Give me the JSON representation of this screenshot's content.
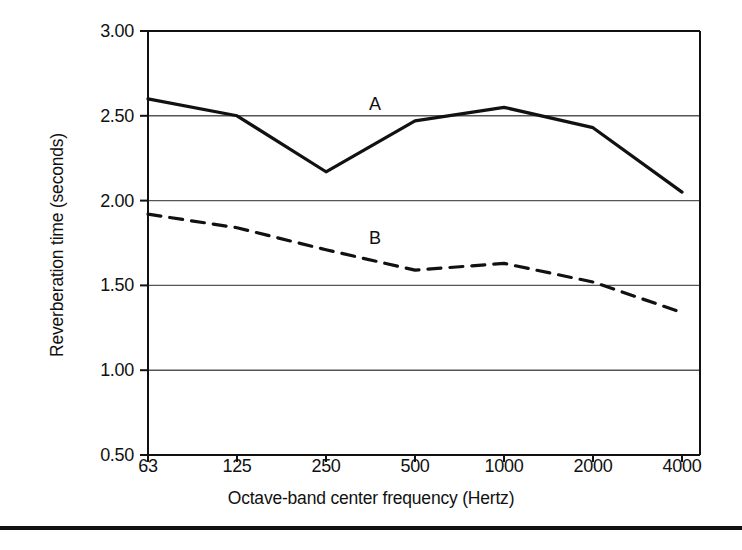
{
  "figure": {
    "background_color": "#ffffff",
    "ink_color": "#111111",
    "gridline_color": "#555555",
    "bottom_rule": true
  },
  "chart_data": {
    "type": "line",
    "title": "",
    "xlabel": "Octave-band center frequency (Hertz)",
    "ylabel": "Reverberation time (seconds)",
    "categories": [
      "63",
      "125",
      "250",
      "500",
      "1000",
      "2000",
      "4000"
    ],
    "x_tick_labels": [
      "63",
      "125",
      "250",
      "500",
      "1000",
      "2000",
      "4000"
    ],
    "y_tick_labels": [
      "0.50",
      "1.00",
      "1.50",
      "2.00",
      "2.50",
      "3.00"
    ],
    "y_ticks": [
      0.5,
      1.0,
      1.5,
      2.0,
      2.5,
      3.0
    ],
    "ylim": [
      0.5,
      3.0
    ],
    "grid": true,
    "grid_axis": "y",
    "legend": "inline-labels",
    "series": [
      {
        "name": "A",
        "label": "A",
        "style": "solid",
        "color": "#111111",
        "values": [
          2.6,
          2.5,
          2.17,
          2.47,
          2.55,
          2.43,
          2.05
        ],
        "label_x": "500",
        "label_y": 2.5
      },
      {
        "name": "B",
        "label": "B",
        "style": "dashed",
        "color": "#111111",
        "values": [
          1.92,
          1.84,
          1.71,
          1.59,
          1.63,
          1.52,
          1.34
        ],
        "label_x": "500",
        "label_y": 1.71
      }
    ]
  }
}
